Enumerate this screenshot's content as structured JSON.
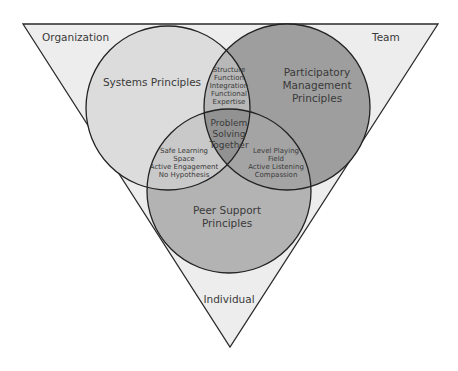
{
  "triangle": {
    "corners": {
      "top_left": "Organization",
      "top_right": "Team",
      "bottom": "Individual"
    },
    "fill": "#ededed",
    "stroke": "#2a2a2a"
  },
  "circles": {
    "systems": {
      "label_lines": [
        "Systems Principles"
      ],
      "fill": "#dcdcdc"
    },
    "participatory": {
      "label_lines": [
        "Participatory",
        "Management",
        "Principles"
      ],
      "fill": "#9e9e9e"
    },
    "peer": {
      "label_lines": [
        "Peer Support",
        "Principles"
      ],
      "fill": "#b3b3b3"
    }
  },
  "overlaps": {
    "systems_participatory": {
      "lines": [
        "Structure",
        "Function",
        "Integration",
        "Functional",
        "Expertise"
      ],
      "fill": "#b8b8b8"
    },
    "systems_peer": {
      "lines": [
        "Safe Learning",
        "Space",
        "Active Engagement",
        "No Hypothesis"
      ],
      "fill": "#c9c9c9"
    },
    "participatory_peer": {
      "lines": [
        "Level Playing",
        "Field",
        "Active Listening",
        "Compassion"
      ],
      "fill": "#9a9a9a"
    },
    "center": {
      "lines": [
        "Problem",
        "Solving",
        "Together"
      ],
      "fill": "#8e8e8e"
    }
  }
}
